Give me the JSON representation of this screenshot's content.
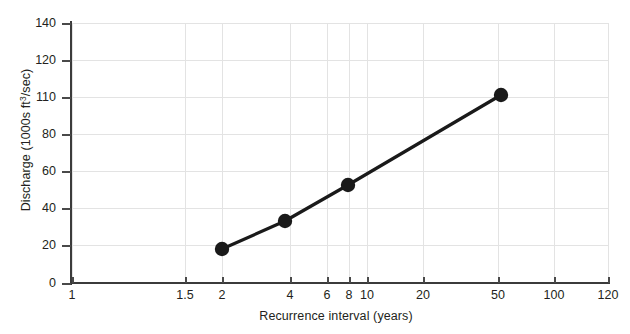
{
  "chart_data": {
    "type": "line",
    "title": "",
    "xlabel": "Recurrence interval (years)",
    "ylabel": "Discharge (1000s ft3/sec)",
    "ylabel_parts": {
      "prefix": "Discharge (1000s ft",
      "sup": "3",
      "suffix": "/sec)"
    },
    "xscale": "log",
    "yscale": "linear",
    "xlim": [
      1,
      120
    ],
    "ylim": [
      0,
      140
    ],
    "grid": true,
    "legend": false,
    "x_tick_labels": [
      "1",
      "1.5",
      "2",
      "4",
      "6",
      "8",
      "10",
      "20",
      "50",
      "100",
      "120"
    ],
    "x_tick_values": [
      1,
      1.5,
      2,
      4,
      6,
      8,
      10,
      20,
      50,
      100,
      120
    ],
    "y_tick_labels": [
      "0",
      "20",
      "40",
      "60",
      "80",
      "110",
      "120",
      "140"
    ],
    "y_tick_values": [
      0,
      20,
      40,
      60,
      80,
      110,
      120,
      140
    ],
    "series": [
      {
        "name": "Discharge",
        "marker": "circle",
        "color": "#1a1a1a",
        "x": [
          2,
          3.8,
          8,
          50
        ],
        "y": [
          16,
          33,
          52,
          110
        ]
      }
    ]
  },
  "axes": {
    "y_title": "Discharge (1000s ft3/sec)",
    "x_title": "Recurrence interval (years)"
  },
  "x_ticks": [
    {
      "label": "1",
      "px": 72
    },
    {
      "label": "1.5",
      "px": 185
    },
    {
      "label": "2",
      "px": 222
    },
    {
      "label": "4",
      "px": 290
    },
    {
      "label": "6",
      "px": 327
    },
    {
      "label": "8",
      "px": 349
    },
    {
      "label": "10",
      "px": 367
    },
    {
      "label": "20",
      "px": 423
    },
    {
      "label": "50",
      "px": 498
    },
    {
      "label": "100",
      "px": 554
    },
    {
      "label": "120",
      "px": 608
    }
  ],
  "y_ticks": [
    {
      "label": "140",
      "px": 23
    },
    {
      "label": "120",
      "px": 60
    },
    {
      "label": "110",
      "px": 97
    },
    {
      "label": "80",
      "px": 134
    },
    {
      "label": "60",
      "px": 171
    },
    {
      "label": "40",
      "px": 208
    },
    {
      "label": "20",
      "px": 245
    },
    {
      "label": "0",
      "px": 283
    }
  ],
  "points_px": [
    {
      "x": 222,
      "y": 249
    },
    {
      "x": 285,
      "y": 221
    },
    {
      "x": 348,
      "y": 185
    },
    {
      "x": 501,
      "y": 95
    }
  ],
  "style": {
    "line_color": "#1a1a1a",
    "grid_color": "#e3e3e3",
    "axis_color": "#3b3b3b",
    "text_color": "#231f20",
    "background": "#ffffff"
  }
}
